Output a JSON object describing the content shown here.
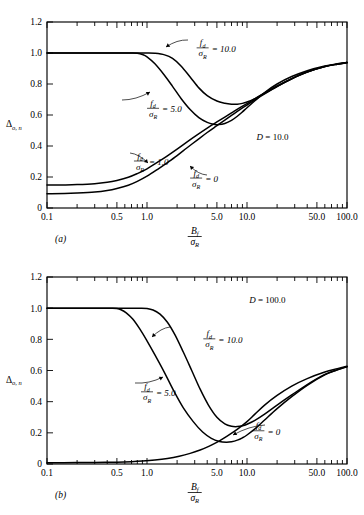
{
  "figure": {
    "y_axis_label": "Δ",
    "y_axis_sub": "o, n",
    "x_axis_num": "B",
    "x_axis_num_sub": "f",
    "x_axis_den": "σ",
    "x_axis_den_sub": "R",
    "param_num": "f",
    "param_num_sub": "d",
    "param_den": "σ",
    "param_den_sub": "R",
    "axis_color": "#000000",
    "curve_color": "#000000",
    "background": "#ffffff"
  },
  "panels": [
    {
      "id": "a",
      "panel_label": "(a)",
      "d_label": "D = 10.0",
      "d_symbol": "D",
      "d_value": "10.0",
      "curve_labels": [
        "= 10.0",
        "= 5.0",
        "= 1.0",
        "= 0"
      ]
    },
    {
      "id": "b",
      "panel_label": "(b)",
      "d_label": "D = 100.0",
      "d_symbol": "D",
      "d_value": "100.0",
      "curve_labels": [
        "= 10.0",
        "= 5.0",
        "= 0"
      ]
    }
  ],
  "chart_data": [
    {
      "type": "line",
      "title": "(a)  D = 10.0",
      "xlabel": "B_f / σ_R",
      "ylabel": "Δ_o,n",
      "xscale": "log",
      "xlim": [
        0.1,
        100.0
      ],
      "ylim": [
        0,
        1.2
      ],
      "yticks": [
        0,
        0.2,
        0.4,
        0.6,
        0.8,
        1.0,
        1.2
      ],
      "ytick_labels": [
        "0",
        "0.2",
        "0.4",
        "0.6",
        "0.8",
        "1.0",
        "1.2"
      ],
      "xticks": [
        0.1,
        0.5,
        1.0,
        5.0,
        10.0,
        50.0,
        100.0
      ],
      "xtick_labels": [
        "0.1",
        "0.5",
        "1.0",
        "5.0",
        "10.0",
        "50.0",
        "100.0"
      ],
      "grid": false,
      "legend": "inline-annotations",
      "annotations": [
        {
          "text": "D = 10.0",
          "x": 18.0,
          "y": 0.44
        },
        {
          "text": "f_d/σ_R = 10.0",
          "x": 3.6,
          "y": 1.03
        },
        {
          "text": "f_d/σ_R = 5.0",
          "x": 1.15,
          "y": 0.64
        },
        {
          "text": "f_d/σ_R = 1.0",
          "x": 0.85,
          "y": 0.3
        },
        {
          "text": "f_d/σ_R = 0",
          "x": 3.1,
          "y": 0.19
        }
      ],
      "series": [
        {
          "name": "f_d/σ_R = 10.0",
          "x": [
            0.1,
            0.2,
            0.35,
            0.5,
            0.7,
            0.85,
            1.0,
            1.2,
            1.5,
            1.8,
            2.2,
            2.7,
            3.3,
            4.0,
            5.0,
            6.0,
            7.0,
            8.0,
            9.0,
            10.0,
            12.0,
            15.0,
            20.0,
            28.0,
            40.0,
            60.0,
            80.0,
            100.0
          ],
          "y": [
            1.0,
            1.0,
            1.0,
            1.0,
            1.0,
            1.0,
            1.0,
            0.998,
            0.988,
            0.965,
            0.915,
            0.845,
            0.775,
            0.725,
            0.69,
            0.676,
            0.67,
            0.67,
            0.675,
            0.684,
            0.706,
            0.74,
            0.785,
            0.834,
            0.877,
            0.912,
            0.928,
            0.938
          ]
        },
        {
          "name": "f_d/σ_R = 5.0",
          "x": [
            0.1,
            0.2,
            0.35,
            0.5,
            0.6,
            0.7,
            0.8,
            0.9,
            1.0,
            1.2,
            1.5,
            1.8,
            2.2,
            2.7,
            3.3,
            4.0,
            4.6,
            5.2,
            6.0,
            7.0,
            8.0,
            9.0,
            10.0,
            12.0,
            15.0,
            20.0,
            28.0,
            40.0,
            60.0,
            80.0,
            100.0
          ],
          "y": [
            1.0,
            1.0,
            1.0,
            1.0,
            1.0,
            1.0,
            0.998,
            0.99,
            0.975,
            0.93,
            0.855,
            0.785,
            0.705,
            0.635,
            0.583,
            0.552,
            0.54,
            0.538,
            0.545,
            0.565,
            0.592,
            0.62,
            0.647,
            0.692,
            0.745,
            0.8,
            0.848,
            0.886,
            0.916,
            0.93,
            0.938
          ]
        },
        {
          "name": "f_d/σ_R = 1.0",
          "x": [
            0.1,
            0.15,
            0.2,
            0.3,
            0.4,
            0.5,
            0.65,
            0.8,
            1.0,
            1.3,
            1.6,
            2.0,
            2.5,
            3.2,
            4.0,
            5.0,
            6.0,
            7.0,
            8.5,
            10.0,
            12.0,
            15.0,
            20.0,
            28.0,
            40.0,
            60.0,
            80.0,
            100.0
          ],
          "y": [
            0.148,
            0.149,
            0.151,
            0.157,
            0.166,
            0.178,
            0.198,
            0.222,
            0.253,
            0.299,
            0.337,
            0.38,
            0.425,
            0.473,
            0.515,
            0.555,
            0.587,
            0.614,
            0.648,
            0.674,
            0.705,
            0.742,
            0.787,
            0.835,
            0.878,
            0.913,
            0.929,
            0.938
          ]
        },
        {
          "name": "f_d/σ_R = 0",
          "x": [
            0.1,
            0.15,
            0.2,
            0.3,
            0.4,
            0.5,
            0.65,
            0.8,
            1.0,
            1.3,
            1.6,
            2.0,
            2.5,
            3.2,
            4.0,
            5.0,
            6.0,
            7.0,
            8.5,
            10.0,
            12.0,
            15.0,
            20.0,
            28.0,
            40.0,
            60.0,
            80.0,
            100.0
          ],
          "y": [
            0.092,
            0.093,
            0.096,
            0.103,
            0.113,
            0.126,
            0.147,
            0.172,
            0.205,
            0.253,
            0.293,
            0.338,
            0.387,
            0.44,
            0.487,
            0.531,
            0.567,
            0.597,
            0.635,
            0.664,
            0.698,
            0.737,
            0.784,
            0.833,
            0.877,
            0.912,
            0.928,
            0.938
          ]
        }
      ]
    },
    {
      "type": "line",
      "title": "(b)  D = 100.0",
      "xlabel": "B_f / σ_R",
      "ylabel": "Δ_o,n",
      "xscale": "log",
      "xlim": [
        0.1,
        100.0
      ],
      "ylim": [
        0,
        1.2
      ],
      "yticks": [
        0,
        0.2,
        0.4,
        0.6,
        0.8,
        1.0,
        1.2
      ],
      "ytick_labels": [
        "0",
        "0.2",
        "0.4",
        "0.6",
        "0.8",
        "1.0",
        "1.2"
      ],
      "xticks": [
        0.1,
        0.5,
        1.0,
        5.0,
        10.0,
        50.0,
        100.0
      ],
      "xtick_labels": [
        "0.1",
        "0.5",
        "1.0",
        "5.0",
        "10.0",
        "50.0",
        "100.0"
      ],
      "grid": false,
      "legend": "inline-annotations",
      "annotations": [
        {
          "text": "D = 100.0",
          "x": 16.0,
          "y": 1.03
        },
        {
          "text": "f_d/σ_R = 10.0",
          "x": 4.2,
          "y": 0.8
        },
        {
          "text": "f_d/σ_R = 5.0",
          "x": 1.0,
          "y": 0.46
        },
        {
          "text": "f_d/σ_R = 0",
          "x": 13.0,
          "y": 0.21
        }
      ],
      "series": [
        {
          "name": "f_d/σ_R = 10.0",
          "x": [
            0.1,
            0.3,
            0.6,
            0.85,
            1.0,
            1.15,
            1.35,
            1.6,
            1.9,
            2.3,
            2.8,
            3.4,
            4.1,
            5.0,
            6.0,
            7.0,
            8.0,
            9.0,
            10.0,
            12.0,
            15.0,
            20.0,
            28.0,
            40.0,
            60.0,
            80.0,
            100.0
          ],
          "y": [
            1.0,
            1.0,
            1.0,
            1.0,
            0.998,
            0.988,
            0.962,
            0.91,
            0.83,
            0.72,
            0.6,
            0.48,
            0.38,
            0.3,
            0.258,
            0.242,
            0.24,
            0.245,
            0.255,
            0.28,
            0.32,
            0.378,
            0.443,
            0.51,
            0.575,
            0.605,
            0.625
          ]
        },
        {
          "name": "f_d/σ_R = 5.0",
          "x": [
            0.1,
            0.2,
            0.35,
            0.45,
            0.5,
            0.55,
            0.62,
            0.72,
            0.85,
            1.0,
            1.2,
            1.5,
            1.85,
            2.3,
            2.9,
            3.6,
            4.4,
            5.3,
            6.2,
            7.0,
            8.0,
            9.0,
            10.0,
            12.0,
            15.0,
            20.0,
            28.0,
            40.0,
            60.0,
            80.0,
            100.0
          ],
          "y": [
            1.0,
            1.0,
            1.0,
            1.0,
            0.998,
            0.99,
            0.97,
            0.93,
            0.865,
            0.79,
            0.7,
            0.585,
            0.47,
            0.362,
            0.272,
            0.205,
            0.165,
            0.145,
            0.14,
            0.143,
            0.153,
            0.168,
            0.186,
            0.225,
            0.282,
            0.355,
            0.432,
            0.505,
            0.572,
            0.604,
            0.624
          ]
        },
        {
          "name": "f_d/σ_R = 0",
          "x": [
            0.1,
            0.2,
            0.3,
            0.5,
            0.7,
            0.9,
            1.2,
            1.6,
            2.1,
            2.7,
            3.4,
            4.2,
            5.2,
            6.2,
            7.4,
            8.6,
            10.0,
            12.0,
            15.0,
            20.0,
            28.0,
            40.0,
            60.0,
            80.0,
            100.0
          ],
          "y": [
            0.008,
            0.009,
            0.01,
            0.012,
            0.015,
            0.019,
            0.026,
            0.036,
            0.05,
            0.068,
            0.09,
            0.115,
            0.145,
            0.175,
            0.207,
            0.238,
            0.272,
            0.32,
            0.378,
            0.44,
            0.5,
            0.548,
            0.59,
            0.612,
            0.628
          ]
        }
      ]
    }
  ]
}
